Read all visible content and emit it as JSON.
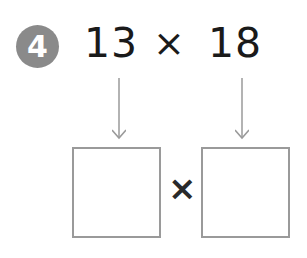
{
  "problem": {
    "number": "4",
    "operand1": "13",
    "operator": "×",
    "operand2": "18"
  },
  "answer": {
    "operator": "×",
    "box1_value": "",
    "box2_value": ""
  },
  "colors": {
    "badge": "#8a8a8a",
    "text": "#1a1a1a",
    "lines": "#9a9a9a"
  }
}
